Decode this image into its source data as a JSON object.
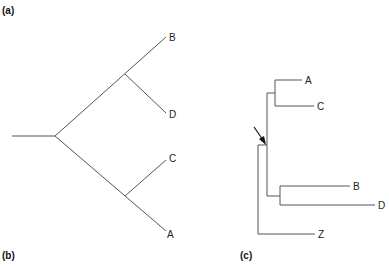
{
  "panels": {
    "a": {
      "label": "(a)"
    },
    "b": {
      "label": "(b)"
    },
    "c": {
      "label": "(c)"
    }
  },
  "tree_ab": {
    "description": "Unrooted-style branching tree with taxa B, D, C, A",
    "taxa": [
      "B",
      "D",
      "C",
      "A"
    ],
    "topology": "((B,D),(C,A))"
  },
  "tree_c": {
    "description": "Rectangular cladogram rooted with outgroup Z; arrow marks root node",
    "taxa": [
      "A",
      "C",
      "B",
      "D",
      "Z"
    ],
    "topology": "(((A,C),(B,D)),Z)",
    "arrow": "root-marker-arrow"
  },
  "colors": {
    "line": "#555555",
    "text": "#222222",
    "arrow": "#111111"
  }
}
